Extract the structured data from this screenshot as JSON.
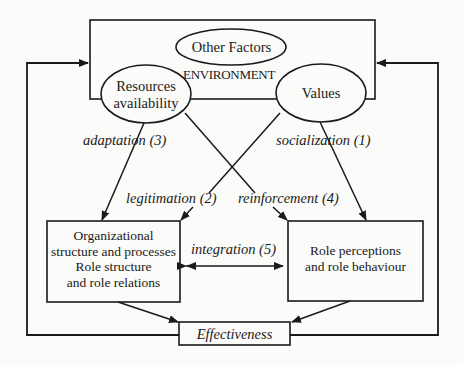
{
  "diagram": {
    "environment": {
      "label": "ENVIRONMENT",
      "other_factors": "Other Factors",
      "resources": [
        "Resources",
        "availability"
      ],
      "values": "Values"
    },
    "edges": {
      "adaptation": "adaptation (3)",
      "socialization": "socialization (1)",
      "legitimation": "legitimation (2)",
      "reinforcement": "reinforcement (4)",
      "integration": "integration (5)"
    },
    "org_box": {
      "lines": [
        "Organizational",
        "structure and processes",
        "Role structure",
        "and role relations"
      ]
    },
    "role_box": {
      "lines": [
        "Role perceptions",
        "and role behaviour"
      ]
    },
    "effectiveness": "Effectiveness"
  }
}
